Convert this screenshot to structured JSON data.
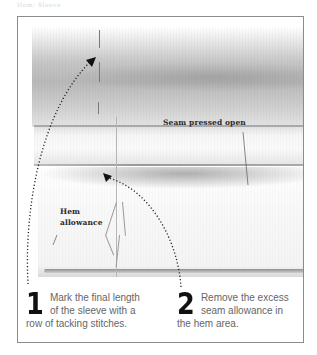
{
  "caption": "Hem: Sleeve",
  "photo": {
    "description": "Sleeve fabric with seam pressed open and tacking stitches marking the hem"
  },
  "labels": {
    "seam_pressed_open": "Seam pressed open",
    "hem_allowance_line1": "Hem",
    "hem_allowance_line2": "allowance"
  },
  "steps": [
    {
      "number": "1",
      "text_line1": "Mark the final length",
      "text_line2": "of the sleeve with a",
      "text_line3": "row of tacking stitches."
    },
    {
      "number": "2",
      "text_line1": "Remove the excess",
      "text_line2": "seam allowance in",
      "text_line3": "the hem area."
    }
  ],
  "colors": {
    "frame_border": "#8c8c8c",
    "step_number": "#111111",
    "step_text": "#666666",
    "label_text": "#2a2a2a",
    "arrow": "#222222"
  }
}
